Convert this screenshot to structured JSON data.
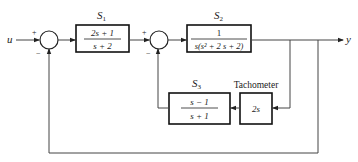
{
  "diagram": {
    "type": "control-block-diagram",
    "input_label": "u",
    "output_label": "y",
    "summing_junctions": [
      {
        "id": "sum1",
        "plus_sign": "+",
        "minus_sign": "−"
      },
      {
        "id": "sum2",
        "plus_sign": "+",
        "minus_sign": "−"
      }
    ],
    "blocks": {
      "s1": {
        "label": "S",
        "subscript": "1",
        "numerator": "2s + 1",
        "denominator": "s + 2"
      },
      "s2": {
        "label": "S",
        "subscript": "2",
        "numerator": "1",
        "denominator": "s(s² + 2 s + 2)"
      },
      "s3": {
        "label": "S",
        "subscript": "3",
        "numerator": "s − 1",
        "denominator": "s + 1"
      },
      "tach": {
        "label": "Tachometer",
        "transfer": "2s"
      }
    },
    "colors": {
      "line": "#444444",
      "box_border": "#111111",
      "background": "#ffffff"
    }
  }
}
